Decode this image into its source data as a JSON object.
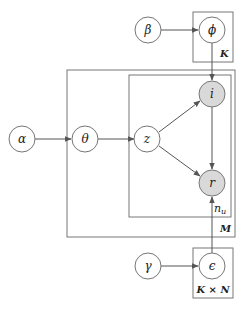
{
  "diagram": {
    "type": "plate-notation-graphical-model",
    "colors": {
      "observed_fill": "#d9d9d9",
      "latent_fill": "#ffffff",
      "stroke": "#666666",
      "edge": "#555555"
    },
    "nodes": [
      {
        "id": "beta",
        "label": "β",
        "observed": false
      },
      {
        "id": "phi",
        "label": "ϕ",
        "observed": false
      },
      {
        "id": "alpha",
        "label": "α",
        "observed": false
      },
      {
        "id": "theta",
        "label": "θ",
        "observed": false
      },
      {
        "id": "z",
        "label": "z",
        "observed": false
      },
      {
        "id": "i",
        "label": "i",
        "observed": true
      },
      {
        "id": "r",
        "label": "r",
        "observed": true
      },
      {
        "id": "gamma",
        "label": "γ",
        "observed": false
      },
      {
        "id": "epsilon",
        "label": "ϵ",
        "observed": false
      }
    ],
    "plates": [
      {
        "id": "plate-K",
        "label": "K"
      },
      {
        "id": "plate-M",
        "label": "M"
      },
      {
        "id": "plate-nu",
        "label": "n",
        "subscript": "u"
      },
      {
        "id": "plate-KxN",
        "label": "K × N"
      }
    ],
    "edges": [
      {
        "from": "beta",
        "to": "phi"
      },
      {
        "from": "phi",
        "to": "i"
      },
      {
        "from": "alpha",
        "to": "theta"
      },
      {
        "from": "theta",
        "to": "z"
      },
      {
        "from": "z",
        "to": "i"
      },
      {
        "from": "z",
        "to": "r"
      },
      {
        "from": "i",
        "to": "r"
      },
      {
        "from": "gamma",
        "to": "epsilon"
      },
      {
        "from": "epsilon",
        "to": "r"
      }
    ]
  }
}
